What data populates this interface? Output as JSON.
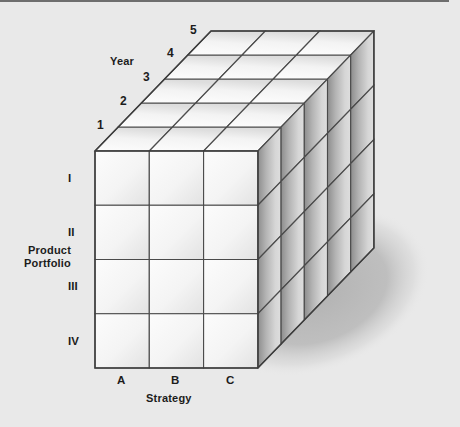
{
  "figure": {
    "type": "3d-matrix-cube-diagram",
    "background_color": "#e9e9e9",
    "border_color": "#6e6e6e"
  },
  "axes": {
    "depth": {
      "name": "year-axis",
      "title": "Year",
      "ticks": [
        "1",
        "2",
        "3",
        "4",
        "5"
      ]
    },
    "vertical": {
      "name": "product-portfolio-axis",
      "title_line1": "Product",
      "title_line2": "Portfolio",
      "ticks": [
        "I",
        "II",
        "III",
        "IV"
      ]
    },
    "horizontal": {
      "name": "strategy-axis",
      "title": "Strategy",
      "ticks": [
        "A",
        "B",
        "C"
      ]
    }
  },
  "cube": {
    "columns": 3,
    "rows": 4,
    "slices": 5,
    "front_origin_x": 95,
    "front_origin_y": 151,
    "cell_width": 54.3,
    "cell_height": 54.25,
    "depth_dx": 23.2,
    "depth_dy": -24.0,
    "edge_color": "#4a4a4a",
    "front_face_light": "#fbfbfb",
    "front_face_dark": "#e3e3e3",
    "top_face_light": "#fdfdfd",
    "top_face_dark": "#dcdcdc",
    "side_face_light": "#dedede",
    "side_face_dark": "#8a8a8a",
    "shadow_color": "#b9b9b9"
  },
  "label_positions": {
    "year_title": {
      "x": 110,
      "y": 55
    },
    "year_ticks": [
      {
        "text": "1",
        "x": 97,
        "y": 118
      },
      {
        "text": "2",
        "x": 120,
        "y": 94
      },
      {
        "text": "3",
        "x": 143,
        "y": 70
      },
      {
        "text": "4",
        "x": 167,
        "y": 46
      },
      {
        "text": "5",
        "x": 190,
        "y": 23
      }
    ],
    "portfolio_title": {
      "x": 24,
      "y": 244
    },
    "portfolio_ticks": [
      {
        "text": "I",
        "x": 68,
        "y": 172
      },
      {
        "text": "II",
        "x": 68,
        "y": 226
      },
      {
        "text": "III",
        "x": 68,
        "y": 280
      },
      {
        "text": "IV",
        "x": 68,
        "y": 335
      }
    ],
    "strategy_ticks": [
      {
        "text": "A",
        "x": 117,
        "y": 374
      },
      {
        "text": "B",
        "x": 171,
        "y": 374
      },
      {
        "text": "C",
        "x": 226,
        "y": 374
      }
    ],
    "strategy_title": {
      "x": 146,
      "y": 392
    }
  }
}
